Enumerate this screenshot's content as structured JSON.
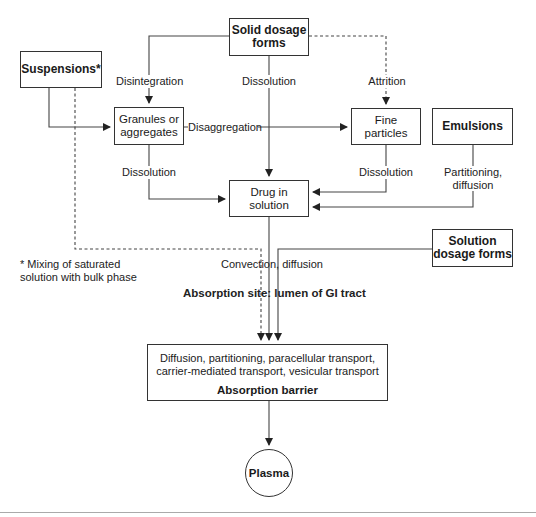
{
  "diagram": {
    "nodes": {
      "solid_dosage_forms": "Solid dosage forms",
      "suspensions": "Suspensions*",
      "granules": "Granules or aggregates",
      "fine_particles": "Fine particles",
      "emulsions": "Emulsions",
      "drug_in_solution": "Drug in solution",
      "solution_dosage_forms": "Solution dosage forms",
      "absorption_barrier_mechanisms": "Diffusion, partitioning, paracellular transport, carrier-mediated transport, vesicular transport",
      "absorption_barrier_title": "Absorption barrier",
      "plasma": "Plasma"
    },
    "edge_labels": {
      "disintegration": "Disintegration",
      "dissolution_solid": "Dissolution",
      "attrition": "Attrition",
      "disaggregation": "Disaggregation",
      "dissolution_granules": "Dissolution",
      "dissolution_fine": "Dissolution",
      "partitioning_diffusion": "Partitioning, diffusion",
      "convection_diffusion": "Convection, diffusion"
    },
    "region_label": "Absorption site: lumen of GI tract",
    "footnote": "* Mixing of saturated solution with bulk phase",
    "colors": {
      "stroke": "#333333",
      "text": "#1a1a1a",
      "background": "#ffffff"
    }
  }
}
